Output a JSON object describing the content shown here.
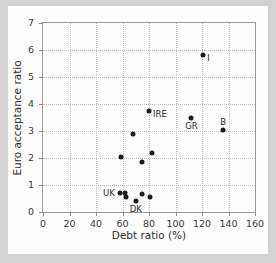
{
  "figure": {
    "background_color": "#fdfdfd",
    "page_border_color": "#d2d2d2",
    "marker_color": "#1b1b1b",
    "grid_color": "#bdbdbd",
    "axis_color": "#9a9a9a"
  },
  "chart_data": {
    "type": "scatter",
    "title": "",
    "xlabel": "Debt ratio (%)",
    "ylabel": "Euro acceptance ratio",
    "xlim": [
      0,
      160
    ],
    "ylim": [
      0,
      7
    ],
    "xticks": [
      0,
      20,
      40,
      60,
      80,
      100,
      120,
      140,
      160
    ],
    "yticks": [
      0,
      1,
      2,
      3,
      4,
      5,
      6,
      7
    ],
    "xticklabels": [
      "0",
      "20",
      "40",
      "60",
      "80",
      "100",
      "120",
      "140",
      "160"
    ],
    "yticklabels": [
      "0",
      "1",
      "2",
      "3",
      "4",
      "5",
      "6",
      "7"
    ],
    "grid": true,
    "grid_style": "dotted",
    "legend": false,
    "points": [
      {
        "x": 121,
        "y": 5.83,
        "label": "I",
        "label_pos": "right"
      },
      {
        "x": 80,
        "y": 3.75,
        "label": "IRE",
        "label_pos": "right"
      },
      {
        "x": 112,
        "y": 3.5,
        "label": "GR",
        "label_pos": "below"
      },
      {
        "x": 136,
        "y": 3.02,
        "label": "B",
        "label_pos": "above"
      },
      {
        "x": 68,
        "y": 2.88,
        "label": "",
        "label_pos": ""
      },
      {
        "x": 82,
        "y": 2.18,
        "label": "",
        "label_pos": ""
      },
      {
        "x": 59,
        "y": 2.05,
        "label": "",
        "label_pos": ""
      },
      {
        "x": 75,
        "y": 1.85,
        "label": "",
        "label_pos": ""
      },
      {
        "x": 58,
        "y": 0.7,
        "label": "UK",
        "label_pos": "left"
      },
      {
        "x": 62,
        "y": 0.72,
        "label": "",
        "label_pos": ""
      },
      {
        "x": 63,
        "y": 0.54,
        "label": "",
        "label_pos": ""
      },
      {
        "x": 70,
        "y": 0.42,
        "label": "DK",
        "label_pos": "below"
      },
      {
        "x": 75,
        "y": 0.68,
        "label": "",
        "label_pos": ""
      },
      {
        "x": 81,
        "y": 0.54,
        "label": "",
        "label_pos": ""
      }
    ]
  }
}
